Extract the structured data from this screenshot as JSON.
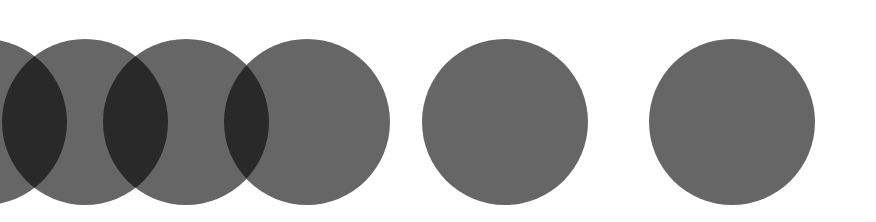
{
  "diagram": {
    "background": "#ffffff",
    "circle_color": "#000000",
    "circle_opacity": 0.6,
    "radius": 83,
    "center_y": 122,
    "circles": [
      {
        "id": "circle-1",
        "cx": -16
      },
      {
        "id": "circle-2",
        "cx": 85
      },
      {
        "id": "circle-3",
        "cx": 186
      },
      {
        "id": "circle-4",
        "cx": 307
      },
      {
        "id": "circle-5",
        "cx": 505
      },
      {
        "id": "circle-6",
        "cx": 732
      }
    ]
  }
}
